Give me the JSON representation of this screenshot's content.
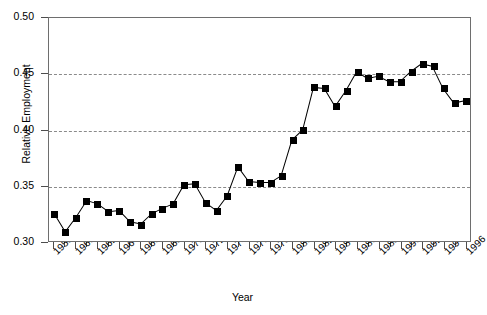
{
  "chart_data": {
    "type": "line",
    "title": "",
    "xlabel": "Year",
    "ylabel": "Relative Employment",
    "xlim": [
      1957.5,
      1996.5
    ],
    "ylim": [
      0.3,
      0.5
    ],
    "yticks": [
      0.3,
      0.35,
      0.4,
      0.45,
      0.5
    ],
    "ytick_labels": [
      "0.30",
      "0.35",
      "0.40",
      "0.45",
      "0.50"
    ],
    "grid": "horizontal-dashed",
    "legend": "none",
    "marker": "filled-square",
    "line_color": "#000000",
    "marker_color": "#000000",
    "xtick_labels": [
      "1958",
      "1960",
      "1962",
      "1964",
      "1966",
      "1968",
      "1970",
      "1972",
      "1974",
      "1976",
      "1978",
      "1980",
      "1982",
      "1984",
      "1986",
      "1988",
      "1990",
      "1992",
      "1994",
      "1996"
    ],
    "x": [
      1958,
      1959,
      1960,
      1961,
      1962,
      1963,
      1964,
      1965,
      1966,
      1967,
      1968,
      1969,
      1970,
      1971,
      1972,
      1973,
      1974,
      1975,
      1976,
      1977,
      1978,
      1979,
      1980,
      1981,
      1982,
      1983,
      1984,
      1985,
      1986,
      1987,
      1988,
      1989,
      1990,
      1991,
      1992,
      1993,
      1994,
      1995,
      1996
    ],
    "values": [
      0.325,
      0.309,
      0.322,
      0.337,
      0.334,
      0.327,
      0.328,
      0.318,
      0.316,
      0.325,
      0.33,
      0.334,
      0.351,
      0.352,
      0.335,
      0.328,
      0.341,
      0.367,
      0.354,
      0.353,
      0.353,
      0.359,
      0.391,
      0.4,
      0.438,
      0.437,
      0.421,
      0.435,
      0.452,
      0.446,
      0.448,
      0.443,
      0.443,
      0.452,
      0.459,
      0.457,
      0.437,
      0.424,
      0.426
    ],
    "series_name": "Relative Employment"
  }
}
